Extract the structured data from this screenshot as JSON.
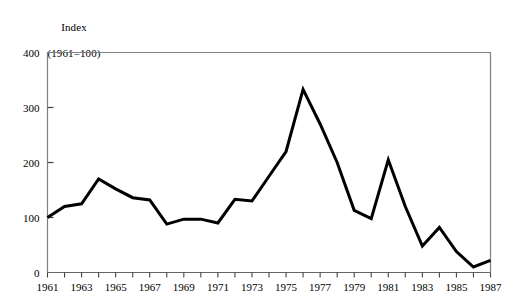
{
  "chart_data": {
    "type": "line",
    "title": "Index\n(1961=100)",
    "title_line1": "Index",
    "title_line2": "(1961=100)",
    "xlabel": "",
    "ylabel": "",
    "ylim": [
      0,
      400
    ],
    "xlim": [
      1961,
      1987
    ],
    "yticks": [
      0,
      100,
      200,
      300,
      400
    ],
    "ytick_labels": [
      "0",
      "100",
      "200",
      "300",
      "400"
    ],
    "xtick_labels": [
      "1961",
      "1963",
      "1965",
      "1967",
      "1969",
      "1971",
      "1973",
      "1975",
      "1977",
      "1979",
      "1981",
      "1983",
      "1985",
      "1987"
    ],
    "xtick_label_years": [
      1961,
      1963,
      1965,
      1967,
      1969,
      1971,
      1973,
      1975,
      1977,
      1979,
      1981,
      1983,
      1985,
      1987
    ],
    "minor_tick_years": [
      1961,
      1962,
      1963,
      1964,
      1965,
      1966,
      1967,
      1968,
      1969,
      1970,
      1971,
      1972,
      1973,
      1974,
      1975,
      1976,
      1977,
      1978,
      1979,
      1980,
      1981,
      1982,
      1983,
      1984,
      1985,
      1986,
      1987
    ],
    "grid": false,
    "legend": false,
    "legend_position": "none",
    "line_color": "#000000",
    "line_width": 3,
    "frame_color": "#808080",
    "x": [
      1961,
      1962,
      1963,
      1964,
      1965,
      1966,
      1967,
      1968,
      1969,
      1970,
      1971,
      1972,
      1973,
      1974,
      1975,
      1976,
      1977,
      1978,
      1979,
      1980,
      1981,
      1982,
      1983,
      1984,
      1985,
      1986,
      1987
    ],
    "values": [
      100,
      120,
      125,
      170,
      152,
      136,
      132,
      88,
      97,
      97,
      90,
      133,
      130,
      175,
      220,
      333,
      270,
      200,
      113,
      98,
      205,
      120,
      48,
      82,
      38,
      10,
      22
    ],
    "series": [
      {
        "name": "Index (1961=100)",
        "values": [
          100,
          120,
          125,
          170,
          152,
          136,
          132,
          88,
          97,
          97,
          90,
          133,
          130,
          175,
          220,
          333,
          270,
          200,
          113,
          98,
          205,
          120,
          48,
          82,
          38,
          10,
          22
        ]
      }
    ]
  }
}
